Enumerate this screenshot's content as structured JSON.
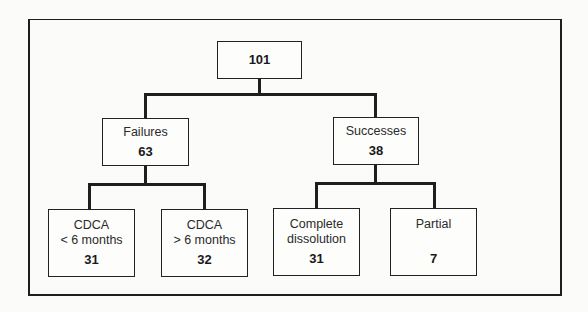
{
  "diagram": {
    "root": {
      "value": "101"
    },
    "branches": [
      {
        "label": "Failures",
        "value": "63",
        "children": [
          {
            "label_line1": "CDCA",
            "label_line2": "< 6 months",
            "value": "31"
          },
          {
            "label_line1": "CDCA",
            "label_line2": "> 6 months",
            "value": "32"
          }
        ]
      },
      {
        "label": "Successes",
        "value": "38",
        "children": [
          {
            "label_line1": "Complete",
            "label_line2": "dissolution",
            "value": "31"
          },
          {
            "label_line1": "Partial",
            "label_line2": "",
            "value": "7"
          }
        ]
      }
    ]
  }
}
